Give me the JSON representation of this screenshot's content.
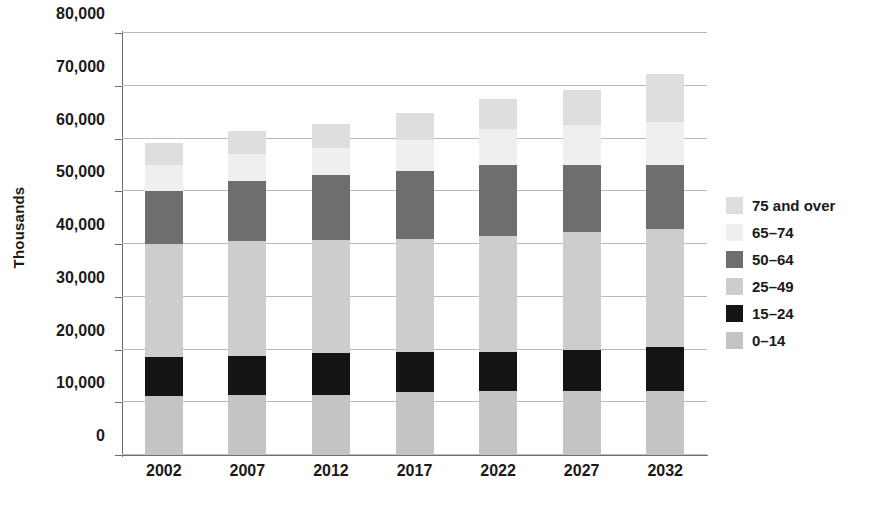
{
  "chart_data": {
    "type": "bar",
    "stacked": true,
    "title": "",
    "xlabel": "",
    "ylabel": "Thousands",
    "categories": [
      "2002",
      "2007",
      "2012",
      "2017",
      "2022",
      "2027",
      "2032"
    ],
    "ylim": [
      0,
      80000
    ],
    "ytick_values": [
      0,
      10000,
      20000,
      30000,
      40000,
      50000,
      60000,
      70000,
      80000
    ],
    "ytick_labels": [
      "0",
      "10,000",
      "20,000",
      "30,000",
      "40,000",
      "50,000",
      "60,000",
      "70,000",
      "80,000"
    ],
    "grid": true,
    "legend_position": "right",
    "series": [
      {
        "name": "0–14",
        "color": "#c4c4c4",
        "values": [
          11200,
          11300,
          11300,
          11900,
          12200,
          12100,
          12100
        ]
      },
      {
        "name": "15–24",
        "color": "#141414",
        "values": [
          7400,
          7400,
          8100,
          7700,
          7400,
          7900,
          8300
        ]
      },
      {
        "name": "25–49",
        "color": "#cdcdcd",
        "values": [
          21400,
          21900,
          21400,
          21400,
          22000,
          22200,
          22400
        ]
      },
      {
        "name": "50–64",
        "color": "#6e6e6e",
        "values": [
          10000,
          11400,
          12200,
          12800,
          13400,
          12800,
          12200
        ]
      },
      {
        "name": "65–74",
        "color": "#efefef",
        "values": [
          5000,
          5000,
          5200,
          6000,
          6800,
          7600,
          8200
        ]
      },
      {
        "name": "75 and over",
        "color": "#dedede",
        "values": [
          4200,
          4400,
          4600,
          5000,
          5600,
          6600,
          9000
        ]
      }
    ],
    "totals": [
      59200,
      61400,
      62800,
      64800,
      67400,
      69200,
      72200
    ]
  },
  "legend": {
    "entries": [
      {
        "label": "75 and over",
        "color": "#dedede"
      },
      {
        "label": "65–74",
        "color": "#efefef"
      },
      {
        "label": "50–64",
        "color": "#6e6e6e"
      },
      {
        "label": "25–49",
        "color": "#cdcdcd"
      },
      {
        "label": "15–24",
        "color": "#141414"
      },
      {
        "label": "0–14",
        "color": "#c4c4c4"
      }
    ]
  },
  "axis": {
    "y_title": "Thousands"
  }
}
